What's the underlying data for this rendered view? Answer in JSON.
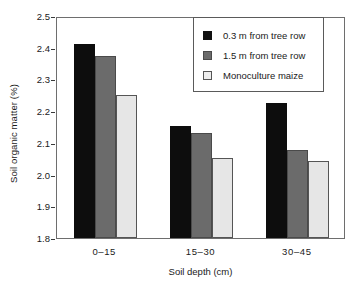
{
  "chart_data": {
    "type": "bar",
    "title": "",
    "xlabel": "Soil depth (cm)",
    "ylabel": "Soil organic matter (%)",
    "categories": [
      "0–15",
      "15–30",
      "30–45"
    ],
    "ylim": [
      1.8,
      2.5
    ],
    "yticks": [
      "2.5",
      "2.4",
      "2.3",
      "2.2",
      "2.1",
      "2.0",
      "1.9",
      "1.8"
    ],
    "ytick_values": [
      2.5,
      2.4,
      2.3,
      2.2,
      2.1,
      2.0,
      1.9,
      1.8
    ],
    "grid": false,
    "legend_position": "top-right",
    "series": [
      {
        "name": "0.3 m from tree row",
        "color": "#0d0d0d",
        "values": [
          2.412,
          2.153,
          2.225
        ]
      },
      {
        "name": "1.5 m from tree row",
        "color": "#6b6b6b",
        "values": [
          2.374,
          2.132,
          2.078
        ]
      },
      {
        "name": "Monoculture maize",
        "color": "#e6e6e6",
        "values": [
          2.252,
          2.052,
          2.044
        ]
      }
    ]
  },
  "legend": {
    "items": [
      {
        "label": "0.3 m from tree row",
        "swatch": "black-square-icon"
      },
      {
        "label": "1.5 m from tree row",
        "swatch": "gray-square-icon"
      },
      {
        "label": "Monoculture maize",
        "swatch": "light-square-icon"
      }
    ]
  },
  "colors": {
    "series_0": "#0d0d0d",
    "series_1": "#6b6b6b",
    "series_2": "#e6e6e6",
    "axis": "#6e6e6e",
    "text": "#1a1a1a",
    "background": "#ffffff"
  }
}
